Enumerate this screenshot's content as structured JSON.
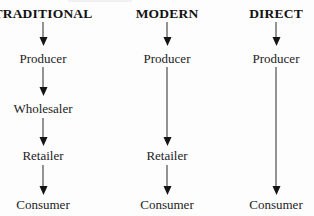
{
  "diagram": {
    "columns": [
      {
        "title": "TRADITIONAL",
        "stages": [
          "Producer",
          "Wholesaler",
          "Retailer",
          "Consumer"
        ]
      },
      {
        "title": "MODERN",
        "stages": [
          "Producer",
          "Retailer",
          "Consumer"
        ]
      },
      {
        "title": "DIRECT",
        "stages": [
          "Producer",
          "Consumer"
        ]
      }
    ],
    "colors": {
      "background": "#fdfdfd",
      "heading_text": "#121212",
      "stage_text": "#232323",
      "arrow": "#141414"
    }
  }
}
